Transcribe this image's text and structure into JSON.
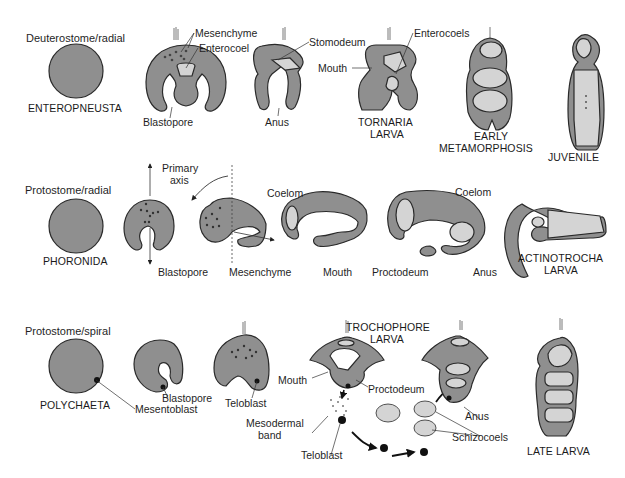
{
  "colors": {
    "tissue": "#8f8f8f",
    "cavity": "#d4d4d4",
    "outline": "#2a2a2a",
    "background": "#ffffff",
    "text": "#1f1f1f"
  },
  "rows": [
    {
      "title": "Deuterostome/radial",
      "taxon": "ENTEROPNEUSTA",
      "labels": {
        "mesenchyme": "Mesenchyme",
        "enterocoel": "Enterocoel",
        "blastopore": "Blastopore",
        "stomodeum": "Stomodeum",
        "anus": "Anus",
        "mouth": "Mouth",
        "enterocoels": "Enterocoels"
      },
      "stages": {
        "tornaria_1": "TORNARIA",
        "tornaria_2": "LARVA",
        "early_meta_1": "EARLY",
        "early_meta_2": "METAMORPHOSIS",
        "juvenile": "JUVENILE"
      }
    },
    {
      "title": "Protostome/radial",
      "taxon": "PHORONIDA",
      "labels": {
        "primary_axis_1": "Primary",
        "primary_axis_2": "axis",
        "blastopore": "Blastopore",
        "mesenchyme": "Mesenchyme",
        "coelom_1": "Coelom",
        "mouth": "Mouth",
        "proctodeum": "Proctodeum",
        "coelom_2": "Coelom",
        "anus": "Anus"
      },
      "stages": {
        "actinotrocha_1": "ACTINOTROCHA",
        "actinotrocha_2": "LARVA"
      }
    },
    {
      "title": "Protostome/spiral",
      "taxon": "POLYCHAETA",
      "labels": {
        "mesentoblast": "Mesentoblast",
        "blastopore": "Blastopore",
        "teloblast_1": "Teloblast",
        "mouth": "Mouth",
        "proctodeum": "Proctodeum",
        "mesodermal_band_1": "Mesodermal",
        "mesodermal_band_2": "band",
        "teloblast_2": "Teloblast",
        "anus": "Anus",
        "schizocoels": "Schizocoels"
      },
      "stages": {
        "trochophore_1": "TROCHOPHORE",
        "trochophore_2": "LARVA",
        "late_larva": "LATE LARVA"
      }
    }
  ]
}
